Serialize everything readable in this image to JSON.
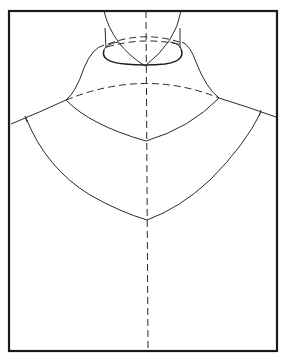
{
  "figure": {
    "type": "pattern-diagram",
    "colors": {
      "background": "#ffffff",
      "line": "#2a2a2a",
      "frame": "#1a1a1a"
    },
    "elements": [
      "frame",
      "neck-column",
      "neck-ellipse",
      "collar-stand",
      "shoulder-lines",
      "yoke-curve",
      "bodice-curve",
      "center-line-dashed"
    ]
  }
}
